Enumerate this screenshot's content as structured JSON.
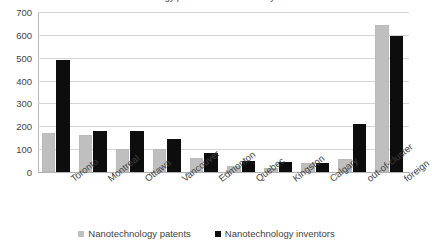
{
  "chart_data": {
    "type": "bar",
    "title": "Nanotechnology patents and inventors by cluster",
    "xlabel": "",
    "ylabel": "",
    "ylim": [
      0,
      700
    ],
    "ytick_step": 100,
    "yticks": [
      "700",
      "600",
      "500",
      "400",
      "300",
      "200",
      "100",
      "0"
    ],
    "grid": true,
    "legend_position": "bottom",
    "categories": [
      "Toronto",
      "Montreal",
      "Ottawa",
      "Vancouver",
      "Edmonton",
      "Quebec",
      "Kingston",
      "Calgary",
      "out-of-cluster",
      "foreign"
    ],
    "series": [
      {
        "name": "Nanotechnology patents",
        "color": "#bfbfbf",
        "values": [
          170,
          160,
          100,
          102,
          60,
          28,
          17,
          38,
          58,
          645
        ]
      },
      {
        "name": "Nanotechnology inventors",
        "color": "#0d0d0d",
        "values": [
          488,
          178,
          180,
          143,
          82,
          50,
          42,
          40,
          208,
          595
        ]
      }
    ]
  }
}
